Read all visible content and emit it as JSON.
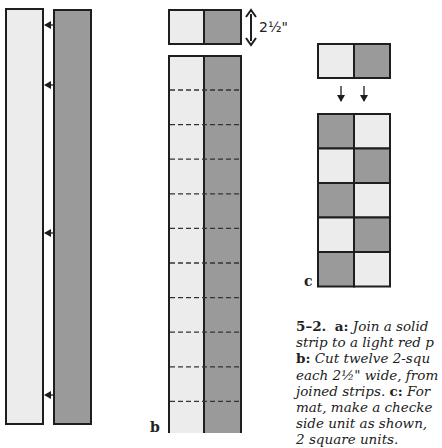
{
  "figure": {
    "number": "5–2.",
    "colors": {
      "light_fabric": "#ececec",
      "dark_fabric": "#9a9a9a",
      "outline": "#1e1e1e"
    },
    "panel_a": {
      "strips": [
        "light",
        "dark"
      ],
      "arrow_count": 4
    },
    "panel_b": {
      "label": "b",
      "dimension_label": "2½\"",
      "cut_lines_visible": 10,
      "unit_squares": [
        "light",
        "dark"
      ]
    },
    "panel_c": {
      "label": "c",
      "top_unit": [
        "light",
        "dark"
      ],
      "checkerboard_rows": [
        [
          "dark",
          "light"
        ],
        [
          "light",
          "dark"
        ],
        [
          "dark",
          "light"
        ],
        [
          "light",
          "dark"
        ],
        [
          "dark",
          "light"
        ]
      ]
    },
    "caption_lines": [
      {
        "parts": [
          {
            "t": "5–2.",
            "s": "b"
          },
          {
            "t": "  ",
            "s": "n"
          },
          {
            "t": "a:",
            "s": "b"
          },
          {
            "t": " Join a solid",
            "s": "i"
          }
        ]
      },
      {
        "parts": [
          {
            "t": "strip to a light red p",
            "s": "i"
          }
        ]
      },
      {
        "parts": [
          {
            "t": "b:",
            "s": "b"
          },
          {
            "t": " Cut twelve 2-squ",
            "s": "i"
          }
        ]
      },
      {
        "parts": [
          {
            "t": "each 2½\" wide, from",
            "s": "i"
          }
        ]
      },
      {
        "parts": [
          {
            "t": "joined strips. ",
            "s": "i"
          },
          {
            "t": "c:",
            "s": "b"
          },
          {
            "t": " For",
            "s": "i"
          }
        ]
      },
      {
        "parts": [
          {
            "t": "mat, make a checke",
            "s": "i"
          }
        ]
      },
      {
        "parts": [
          {
            "t": "side unit as shown,",
            "s": "i"
          }
        ]
      },
      {
        "parts": [
          {
            "t": "2 square units.",
            "s": "i"
          }
        ]
      }
    ]
  }
}
